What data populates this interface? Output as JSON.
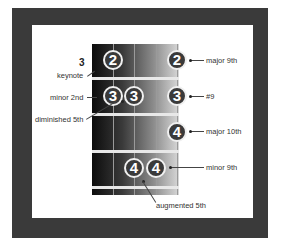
{
  "diagram": {
    "type": "guitar-fretboard-chord-diagram",
    "fret_number": "3",
    "colors": {
      "frame": "#3a3a3a",
      "note_fill": "#3a3a3a",
      "note_text": "#ffffff"
    },
    "notes": [
      {
        "finger": "2",
        "x": 113,
        "y": 60
      },
      {
        "finger": "2",
        "x": 177,
        "y": 60
      },
      {
        "finger": "3",
        "x": 113,
        "y": 96
      },
      {
        "finger": "3",
        "x": 134,
        "y": 96
      },
      {
        "finger": "3",
        "x": 177,
        "y": 96
      },
      {
        "finger": "4",
        "x": 177,
        "y": 132
      },
      {
        "finger": "4",
        "x": 134,
        "y": 168
      },
      {
        "finger": "4",
        "x": 156,
        "y": 168
      }
    ],
    "left_labels": {
      "keynote": "keynote",
      "minor_2nd": "minor 2nd",
      "diminished_5th": "diminished 5th"
    },
    "right_labels": {
      "major_9th": "major 9th",
      "sharp_9": "#9",
      "major_10th": "major 10th",
      "minor_9th": "minor 9th"
    },
    "bottom_labels": {
      "augmented_5th": "augmented 5th"
    }
  }
}
